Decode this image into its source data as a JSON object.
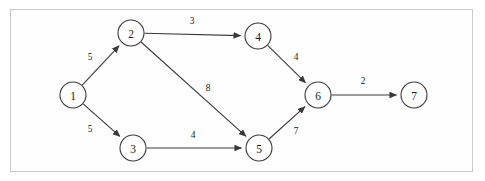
{
  "diagram": {
    "type": "directed-weighted-graph",
    "frame": {
      "border_color": "#c9c9c9",
      "background": "#fefefe"
    },
    "style": {
      "node_stroke": "#3a3a3a",
      "node_fill": "#ffffff",
      "edge_stroke": "#3a3a3a",
      "text_color": "#1a1a1a",
      "node_radius": 13
    },
    "nodes": [
      {
        "id": "1",
        "label": "1",
        "cx": 73,
        "cy": 95
      },
      {
        "id": "2",
        "label": "2",
        "cx": 131,
        "cy": 33
      },
      {
        "id": "3",
        "label": "3",
        "cx": 133,
        "cy": 148
      },
      {
        "id": "4",
        "label": "4",
        "cx": 258,
        "cy": 36
      },
      {
        "id": "5",
        "label": "5",
        "cx": 259,
        "cy": 148
      },
      {
        "id": "6",
        "label": "6",
        "cx": 318,
        "cy": 95
      },
      {
        "id": "7",
        "label": "7",
        "cx": 414,
        "cy": 95
      }
    ],
    "edges": [
      {
        "from": "1",
        "to": "2",
        "weight": "5",
        "lx": 90,
        "ly": 57
      },
      {
        "from": "1",
        "to": "3",
        "weight": "5",
        "lx": 90,
        "ly": 129
      },
      {
        "from": "2",
        "to": "4",
        "weight": "3",
        "lx": 192,
        "ly": 21
      },
      {
        "from": "2",
        "to": "5",
        "weight": "8",
        "lx": 208,
        "ly": 88
      },
      {
        "from": "3",
        "to": "5",
        "weight": "4",
        "lx": 193,
        "ly": 135
      },
      {
        "from": "4",
        "to": "6",
        "weight": "4",
        "lx": 296,
        "ly": 57
      },
      {
        "from": "5",
        "to": "6",
        "weight": "7",
        "lx": 296,
        "ly": 131
      },
      {
        "from": "6",
        "to": "7",
        "weight": "2",
        "lx": 363,
        "ly": 81
      }
    ]
  }
}
